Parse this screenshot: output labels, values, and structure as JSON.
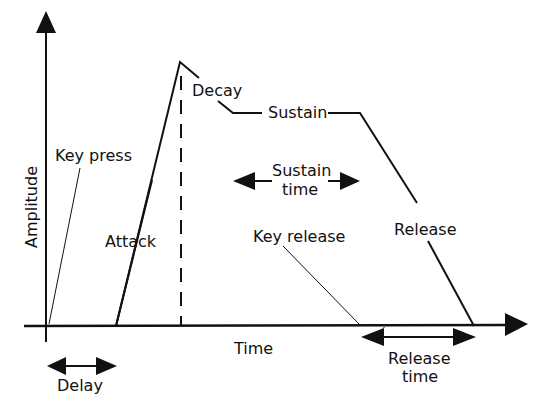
{
  "diagram": {
    "axes": {
      "y_label": "Amplitude",
      "x_label": "Time"
    },
    "labels": {
      "key_press": "Key press",
      "attack": "Attack",
      "decay": "Decay",
      "sustain": "Sustain",
      "sustain_time_line1": "Sustain",
      "sustain_time_line2": "time",
      "key_release": "Key release",
      "release": "Release",
      "release_time_line1": "Release",
      "release_time_line2": "time",
      "delay": "Delay"
    },
    "colors": {
      "stroke": "#111111",
      "background": "#ffffff"
    }
  }
}
